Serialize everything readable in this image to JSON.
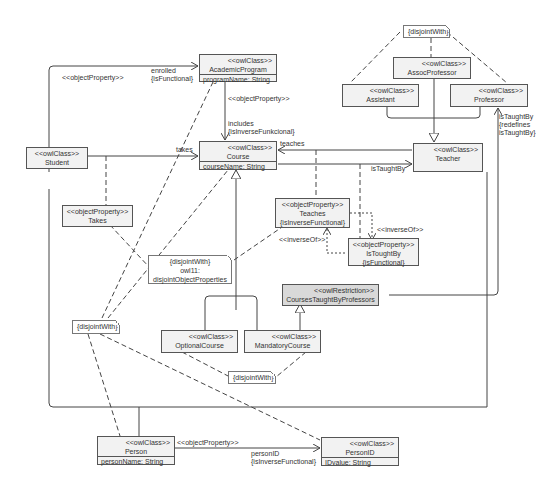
{
  "classes": {
    "academic_program": {
      "stereotype": "<<owlClass>>",
      "name": "AcademicProgram",
      "attr": "programName: String"
    },
    "course": {
      "stereotype": "<<owlClass>>",
      "name": "Course",
      "attr": "courseName: String"
    },
    "student": {
      "stereotype": "<<owlClass>>",
      "name": "Student"
    },
    "teacher": {
      "stereotype": "<<owlClass>>",
      "name": "Teacher"
    },
    "assoc_professor": {
      "stereotype": "<<owlClass>>",
      "name": "AssocProfessor"
    },
    "assistant": {
      "stereotype": "<<owlClass>>",
      "name": "Assistant"
    },
    "professor": {
      "stereotype": "<<owlClass>>",
      "name": "Professor"
    },
    "takes_prop": {
      "stereotype": "<<objectProperty>>",
      "name": "Takes"
    },
    "teaches_prop": {
      "stereotype": "<<objectProperty>>",
      "name": "Teaches",
      "constraint": "{isInverseFunctional}"
    },
    "is_taught_by_prop": {
      "stereotype": "<<objectProperty>>",
      "name": "IsToughtBy",
      "constraint": "{isFunctional}"
    },
    "courses_taught_by_professors": {
      "stereotype": "<<owlRestriction>>",
      "name": "CoursesTaughtByProfessors"
    },
    "optional_course": {
      "stereotype": "<<owlClass>>",
      "name": "OptionalCourse"
    },
    "mandatory_course": {
      "stereotype": "<<owlClass>>",
      "name": "MandatoryCourse"
    },
    "person": {
      "stereotype": "<<owlClass>>",
      "name": "Person",
      "attr": "personName: String"
    },
    "person_id": {
      "stereotype": "<<owlClass>>",
      "name": "PersonID",
      "attr": "IDvalue: String"
    }
  },
  "notes": {
    "disjoint_top": "{disjointWith}",
    "disjoint_props_line1": "{disjointWith}",
    "disjoint_props_line2": "owl11:",
    "disjoint_props_line3": "disjointObjectProperties",
    "disjoint_left": "{disjointWith}",
    "disjoint_courses": "{disjointWith}"
  },
  "labels": {
    "object_property_top": "<<objectProperty>>",
    "enrolled": "enrolled",
    "is_functional": "{isFunctional}",
    "object_property_includes": "<<objectProperty>>",
    "includes": "includes",
    "is_inverse_funkcional": "{isInverseFunkcional}",
    "takes": "takes",
    "teaches": "teaches",
    "is_taught_by": "isTaughtBy",
    "inverse_of_right": "<<inverseOf>>",
    "inverse_of_left": "<<inverseOf>>",
    "is_taught_by_redef_1": "isTaughtBy",
    "is_taught_by_redef_2": "{redefines",
    "is_taught_by_redef_3": "isTaughtBy}",
    "object_property_person": "<<objectProperty>>",
    "person_id_role": "personID",
    "is_inverse_functional": "{isInverseFunctional}"
  }
}
